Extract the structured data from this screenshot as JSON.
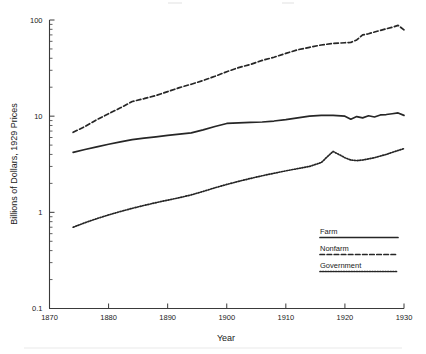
{
  "chart_data": {
    "type": "line",
    "title": "",
    "xlabel": "Year",
    "ylabel": "Billions of Dollars, 1929 Prices",
    "xlim": [
      1870,
      1930
    ],
    "ylim": [
      0.1,
      100
    ],
    "yscale": "log",
    "grid": false,
    "legend_position": "bottom-right",
    "xticks": [
      1870,
      1880,
      1890,
      1900,
      1910,
      1920,
      1930
    ],
    "xtick_labels": [
      "1870",
      "1880",
      "1890",
      "1900",
      "1910",
      "1920",
      "1930"
    ],
    "yticks": [
      0.1,
      1,
      10,
      100
    ],
    "ytick_labels": [
      "0.1",
      "1",
      "10",
      "100"
    ],
    "x": [
      1874,
      1876,
      1878,
      1880,
      1882,
      1884,
      1886,
      1888,
      1890,
      1892,
      1894,
      1896,
      1898,
      1900,
      1902,
      1904,
      1906,
      1908,
      1910,
      1912,
      1914,
      1916,
      1918,
      1920,
      1921,
      1922,
      1923,
      1924,
      1925,
      1926,
      1927,
      1928,
      1929,
      1930
    ],
    "series": [
      {
        "name": "Farm",
        "style": "solid",
        "values": [
          4.2,
          4.5,
          4.8,
          5.1,
          5.4,
          5.7,
          5.9,
          6.1,
          6.3,
          6.5,
          6.7,
          7.2,
          7.8,
          8.4,
          8.5,
          8.6,
          8.7,
          8.9,
          9.2,
          9.6,
          10.0,
          10.2,
          10.2,
          10.0,
          9.3,
          9.9,
          9.6,
          10.1,
          9.8,
          10.3,
          10.4,
          10.6,
          10.8,
          10.2
        ]
      },
      {
        "name": "Nonfarm",
        "style": "dashed",
        "values": [
          6.8,
          7.8,
          9.2,
          10.6,
          12.2,
          14.2,
          15.2,
          16.4,
          18.0,
          19.8,
          21.5,
          23.5,
          26.0,
          29.0,
          32.0,
          34.5,
          38.0,
          41.0,
          45.0,
          49.0,
          52.0,
          55.0,
          57.0,
          58.0,
          58.5,
          62.0,
          70.0,
          72.0,
          75.0,
          78.0,
          81.0,
          84.0,
          88.0,
          79.0
        ]
      },
      {
        "name": "Government",
        "style": "dotted",
        "values": [
          0.7,
          0.78,
          0.86,
          0.94,
          1.02,
          1.1,
          1.18,
          1.26,
          1.34,
          1.42,
          1.52,
          1.65,
          1.8,
          1.95,
          2.1,
          2.25,
          2.4,
          2.55,
          2.7,
          2.85,
          3.0,
          3.3,
          4.3,
          3.7,
          3.5,
          3.45,
          3.5,
          3.6,
          3.7,
          3.85,
          4.0,
          4.2,
          4.4,
          4.6
        ]
      }
    ]
  },
  "legend": {
    "items": [
      {
        "label": "Farm",
        "style": "solid"
      },
      {
        "label": "Nonfarm",
        "style": "dashed"
      },
      {
        "label": "Government",
        "style": "dotted"
      }
    ]
  },
  "axes": {
    "x_title": "Year",
    "y_title": "Billions of Dollars, 1929 Prices"
  }
}
